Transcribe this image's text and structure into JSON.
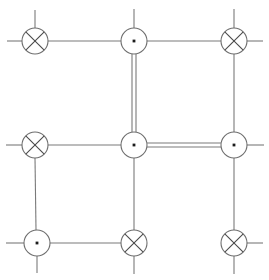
{
  "diagram": {
    "type": "node-link-lattice",
    "canvas": {
      "width": 269,
      "height": 280,
      "background": "#ffffff"
    },
    "style": {
      "line_color": "#7a7a7a",
      "node_stroke_color": "#6e6e6e",
      "node_fill_color": "#ffffff",
      "cross_color": "#4a4a4a",
      "dot_color": "#1c1c1c",
      "line_width": 1.1,
      "node_radius": 13,
      "double_line_gap": 4
    },
    "nodes": [
      {
        "id": "n-top-left",
        "label": "top-left",
        "glyph": "cross-circle",
        "x": 35,
        "y": 41,
        "r": 13
      },
      {
        "id": "n-top-center",
        "label": "top-center",
        "glyph": "dot-circle",
        "x": 134,
        "y": 41,
        "r": 13
      },
      {
        "id": "n-top-right",
        "label": "top-right",
        "glyph": "cross-circle",
        "x": 234,
        "y": 41,
        "r": 13
      },
      {
        "id": "n-middle-left",
        "label": "middle-left",
        "glyph": "cross-circle",
        "x": 35,
        "y": 145,
        "r": 13
      },
      {
        "id": "n-middle-center",
        "label": "middle-center",
        "glyph": "dot-circle",
        "x": 134,
        "y": 145,
        "r": 13
      },
      {
        "id": "n-middle-right",
        "label": "middle-right",
        "glyph": "dot-circle",
        "x": 234,
        "y": 145,
        "r": 13
      },
      {
        "id": "n-bottom-left",
        "label": "bottom-left",
        "glyph": "dot-circle",
        "x": 37,
        "y": 243,
        "r": 13
      },
      {
        "id": "n-bottom-center",
        "label": "bottom-center",
        "glyph": "cross-circle",
        "x": 134,
        "y": 243,
        "r": 13
      },
      {
        "id": "n-bottom-right",
        "label": "bottom-right",
        "glyph": "cross-circle",
        "x": 234,
        "y": 243,
        "r": 13
      }
    ],
    "edges": [
      {
        "id": "e-tl-tc",
        "label": "top-left-to-top-center",
        "kind": "single",
        "x1": 48,
        "y1": 41,
        "x2": 121,
        "y2": 41
      },
      {
        "id": "e-tc-tr",
        "label": "top-center-to-top-right",
        "kind": "single",
        "x1": 147,
        "y1": 41,
        "x2": 221,
        "y2": 41
      },
      {
        "id": "e-tc-mc",
        "label": "top-center-to-middle-center",
        "kind": "double",
        "x1": 134,
        "y1": 54,
        "x2": 134,
        "y2": 132
      },
      {
        "id": "e-tr-mr",
        "label": "top-right-to-middle-right",
        "kind": "single",
        "x1": 234,
        "y1": 54,
        "x2": 234,
        "y2": 132
      },
      {
        "id": "e-ml-mc",
        "label": "middle-left-to-middle-center",
        "kind": "single",
        "x1": 48,
        "y1": 145,
        "x2": 121,
        "y2": 145
      },
      {
        "id": "e-mc-mr",
        "label": "middle-center-to-middle-right",
        "kind": "double",
        "x1": 147,
        "y1": 145,
        "x2": 221,
        "y2": 145
      },
      {
        "id": "e-ml-bl",
        "label": "middle-left-to-bottom-left",
        "kind": "single",
        "x1": 35,
        "y1": 158,
        "x2": 36,
        "y2": 230
      },
      {
        "id": "e-mc-bc",
        "label": "middle-center-to-bottom-center",
        "kind": "single",
        "x1": 134,
        "y1": 158,
        "x2": 134,
        "y2": 230
      },
      {
        "id": "e-bl-bc",
        "label": "bottom-left-to-bottom-center",
        "kind": "single",
        "x1": 50,
        "y1": 243,
        "x2": 121,
        "y2": 243
      }
    ],
    "stubs": [
      {
        "id": "s-tl-up",
        "label": "top-left-up-stub",
        "x1": 35,
        "y1": 10,
        "x2": 35,
        "y2": 28
      },
      {
        "id": "s-tl-left",
        "label": "top-left-left-stub",
        "x1": 7,
        "y1": 41,
        "x2": 22,
        "y2": 41
      },
      {
        "id": "s-tc-up",
        "label": "top-center-up-stub",
        "x1": 134,
        "y1": 9,
        "x2": 134,
        "y2": 28
      },
      {
        "id": "s-tr-up",
        "label": "top-right-up-stub",
        "x1": 234,
        "y1": 9,
        "x2": 234,
        "y2": 28
      },
      {
        "id": "s-tr-right",
        "label": "top-right-right-stub",
        "x1": 247,
        "y1": 41,
        "x2": 263,
        "y2": 41
      },
      {
        "id": "s-ml-left",
        "label": "middle-left-left-stub",
        "x1": 6,
        "y1": 145,
        "x2": 22,
        "y2": 145
      },
      {
        "id": "s-mr-right",
        "label": "middle-right-right-stub",
        "x1": 247,
        "y1": 145,
        "x2": 264,
        "y2": 145
      },
      {
        "id": "s-mr-up",
        "label": "middle-right-up-stub",
        "x1": 234,
        "y1": 132,
        "x2": 234,
        "y2": 132
      },
      {
        "id": "s-mr-down",
        "label": "middle-right-down-stub",
        "x1": 234,
        "y1": 158,
        "x2": 234,
        "y2": 230
      },
      {
        "id": "s-bl-left",
        "label": "bottom-left-left-stub",
        "x1": 6,
        "y1": 243,
        "x2": 24,
        "y2": 243
      },
      {
        "id": "s-bl-up",
        "label": "bottom-left-up-stub",
        "x1": 36,
        "y1": 230,
        "x2": 36,
        "y2": 230
      },
      {
        "id": "s-bl-down",
        "label": "bottom-left-down-stub",
        "x1": 37,
        "y1": 256,
        "x2": 37,
        "y2": 273
      },
      {
        "id": "s-bc-down",
        "label": "bottom-center-down-stub",
        "x1": 134,
        "y1": 256,
        "x2": 134,
        "y2": 274
      },
      {
        "id": "s-br-right",
        "label": "bottom-right-right-stub",
        "x1": 247,
        "y1": 243,
        "x2": 263,
        "y2": 243
      },
      {
        "id": "s-br-down",
        "label": "bottom-right-down-stub",
        "x1": 234,
        "y1": 256,
        "x2": 234,
        "y2": 274
      }
    ]
  }
}
